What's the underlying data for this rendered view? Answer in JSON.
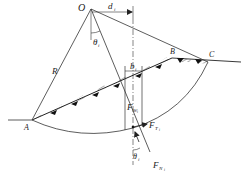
{
  "diagram": {
    "points": {
      "O": {
        "label": "O"
      },
      "A": {
        "label": "A"
      },
      "B": {
        "label": "B"
      },
      "C": {
        "label": "C"
      }
    },
    "dimensions": {
      "radius": {
        "label": "R"
      },
      "lever_arm": {
        "label": "d",
        "sub": "i"
      },
      "slice_width": {
        "label": "b",
        "sub": "i"
      },
      "angle_top": {
        "label": "θ",
        "sub": "i"
      },
      "angle_bottom": {
        "label": "θ",
        "sub": "i"
      }
    },
    "forces": {
      "weight": {
        "label": "F",
        "sub": "W",
        "subsub": "i"
      },
      "tangential": {
        "label": "F",
        "sub": "T",
        "subsub": "i"
      },
      "normal": {
        "label": "F",
        "sub": "N",
        "subsub": "i"
      }
    }
  }
}
